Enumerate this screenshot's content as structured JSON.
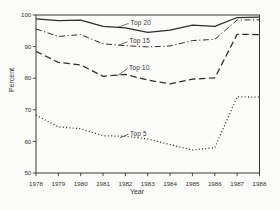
{
  "figure": {
    "background": "#fbfbf9",
    "ink_color": "#2f2f2f",
    "axis_color": "#3a3a3a",
    "text_color": "#333333"
  },
  "chart_data": {
    "type": "line",
    "title": "",
    "xlabel": "Year",
    "ylabel": "Percent",
    "x": [
      1978,
      1979,
      1980,
      1981,
      1982,
      1983,
      1984,
      1985,
      1986,
      1987,
      1988
    ],
    "xlim": [
      1978,
      1988
    ],
    "ylim": [
      50,
      100
    ],
    "yticks": [
      50,
      60,
      70,
      80,
      90,
      100
    ],
    "xticks": [
      1978,
      1979,
      1980,
      1981,
      1982,
      1983,
      1984,
      1985,
      1986,
      1987,
      1988
    ],
    "grid": false,
    "frame_box": true,
    "legend_position": "inline-annotations",
    "series": [
      {
        "name": "Top 20",
        "line_style": "solid",
        "values": [
          98.8,
          98.2,
          98.4,
          96.4,
          95.9,
          94.5,
          95.2,
          96.8,
          96.4,
          99.2,
          99.3
        ]
      },
      {
        "name": "Top 15",
        "line_style": "dashdot",
        "values": [
          95.6,
          93.2,
          93.8,
          90.9,
          90.3,
          89.9,
          90.2,
          91.9,
          92.3,
          98.4,
          98.5
        ]
      },
      {
        "name": "Top 10",
        "line_style": "dashed",
        "values": [
          88.5,
          85.0,
          84.2,
          80.6,
          81.2,
          79.4,
          78.2,
          79.7,
          80.1,
          93.9,
          93.8
        ]
      },
      {
        "name": "Top 5",
        "line_style": "dotted",
        "values": [
          68.3,
          64.6,
          64.0,
          61.8,
          61.6,
          60.8,
          59.0,
          57.3,
          58.0,
          74.1,
          74.0
        ]
      }
    ],
    "annotations": [
      {
        "text": "Top 20",
        "text_x": 130.5,
        "text_y": 25.0,
        "leader": [
          117.5,
          27.5,
          128.5,
          23.5
        ]
      },
      {
        "text": "Top 15",
        "text_x": 129.5,
        "text_y": 43.0,
        "leader": [
          118.5,
          45.2,
          127.5,
          41.8
        ]
      },
      {
        "text": "Top 10",
        "text_x": 129.0,
        "text_y": 70.0,
        "leader": [
          117.0,
          76.0,
          127.5,
          68.5
        ]
      },
      {
        "text": "Top 5",
        "text_x": 130.0,
        "text_y": 136.0,
        "leader": [
          120.0,
          137.8,
          128.5,
          134.2
        ]
      }
    ],
    "layout": {
      "plot_left": 36,
      "plot_right": 259.5,
      "plot_top": 15,
      "plot_bottom": 173,
      "ylabel_x": 13.5,
      "ylabel_y": 80,
      "xlabel_x": 137,
      "xlabel_y": 194,
      "tick_len": 3.2
    }
  }
}
